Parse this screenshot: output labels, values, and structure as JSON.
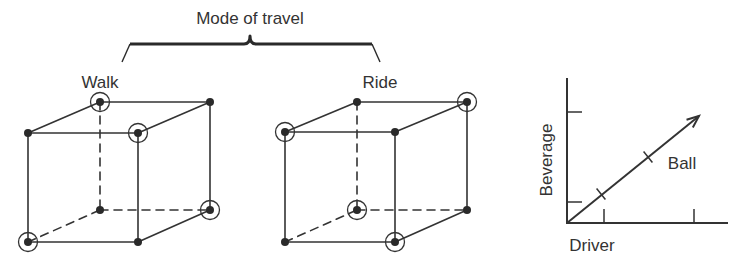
{
  "title": "Mode of travel",
  "brace": {
    "left_end": [
      122,
      62
    ],
    "left_corner": [
      130,
      44
    ],
    "mid": [
      250,
      44
    ],
    "peak": [
      250,
      36
    ],
    "right_corner": [
      372,
      44
    ],
    "right_end": [
      380,
      62
    ]
  },
  "cubes": [
    {
      "label": "Walk",
      "label_pos": [
        100,
        88
      ],
      "vertices": {
        "ftl": [
          28,
          133
        ],
        "ftr": [
          138,
          133
        ],
        "fbl": [
          28,
          242
        ],
        "fbr": [
          138,
          242
        ],
        "btl": [
          100,
          102
        ],
        "btr": [
          210,
          102
        ],
        "bbl": [
          100,
          210
        ],
        "bbr": [
          210,
          210
        ]
      },
      "circled": [
        "btl",
        "ftr",
        "bbr",
        "fbl"
      ]
    },
    {
      "label": "Ride",
      "label_pos": [
        380,
        88
      ],
      "vertices": {
        "ftl": [
          285,
          132
        ],
        "ftr": [
          395,
          132
        ],
        "fbl": [
          285,
          242
        ],
        "fbr": [
          395,
          242
        ],
        "btl": [
          357,
          102
        ],
        "btr": [
          467,
          102
        ],
        "bbl": [
          357,
          210
        ],
        "bbr": [
          467,
          210
        ]
      },
      "circled": [
        "ftl",
        "btr",
        "bbl",
        "fbr"
      ]
    }
  ],
  "chart_data": {
    "type": "line",
    "title": "",
    "xlabel": "Driver",
    "ylabel": "Beverage",
    "series": [
      {
        "name": "Ball",
        "x": [
          0,
          1,
          2,
          3.3
        ],
        "y": [
          0,
          1,
          2,
          3.3
        ]
      }
    ],
    "x_ticks": [
      1,
      2
    ],
    "y_ticks": [
      1,
      2
    ],
    "annotations": [
      "Ball"
    ],
    "arrow": true,
    "grid": false
  },
  "graph": {
    "origin": [
      567,
      223
    ],
    "y_axis_top": [
      567,
      78
    ],
    "x_axis_right": [
      728,
      223
    ],
    "y_ticks": [
      202,
      112
    ],
    "y_tick_len": 15,
    "x_ticks": [
      604,
      694
    ],
    "x_tick_len": 14,
    "vector_tip": [
      699,
      116
    ],
    "vector_ticks": [
      [
        601,
        194
      ],
      [
        648,
        157
      ]
    ],
    "labels": {
      "x": "Driver",
      "y": "Beverage",
      "vector": "Ball"
    },
    "x_label_pos": [
      592,
      251
    ],
    "y_label_pos": [
      552,
      160
    ],
    "vector_label_pos": [
      682,
      169
    ]
  },
  "colors": {
    "ink": "#333333",
    "background": "#ffffff"
  }
}
